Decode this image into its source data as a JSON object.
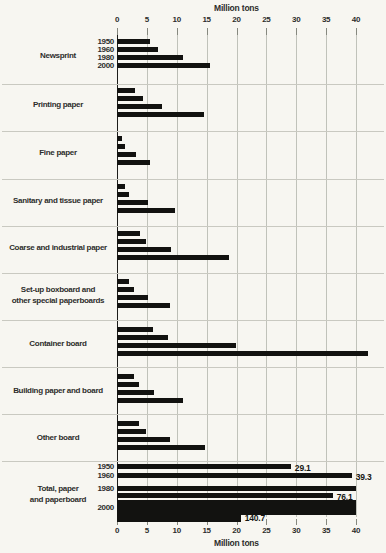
{
  "chart_data": {
    "type": "bar",
    "orientation": "horizontal",
    "unit": "Million tons",
    "top_axis_label": "Million tons",
    "bottom_axis_label": "Million tons",
    "xlim": [
      0,
      40
    ],
    "ticks": [
      0,
      5,
      10,
      15,
      20,
      25,
      30,
      35,
      40
    ],
    "grid": true,
    "series_years": [
      "1950",
      "1960",
      "1980",
      "2000"
    ],
    "groups": [
      {
        "category": "Newsprint",
        "category_lines": [
          "Newsprint"
        ],
        "values": [
          5.5,
          6.9,
          11.0,
          15.5
        ],
        "show_years": true
      },
      {
        "category": "Printing paper",
        "category_lines": [
          "Printing paper"
        ],
        "values": [
          3.0,
          4.3,
          7.5,
          14.5
        ]
      },
      {
        "category": "Fine paper",
        "category_lines": [
          "Fine paper"
        ],
        "values": [
          0.9,
          1.3,
          3.2,
          5.5
        ]
      },
      {
        "category": "Sanitary and tissue paper",
        "category_lines": [
          "Sanitary and tissue paper"
        ],
        "values": [
          1.3,
          2.0,
          5.2,
          9.7
        ]
      },
      {
        "category": "Coarse and industrial paper",
        "category_lines": [
          "Coarse and industrial paper"
        ],
        "values": [
          3.8,
          4.8,
          9.0,
          18.8
        ]
      },
      {
        "category": "Set-up boxboard and other special paperboards",
        "category_lines": [
          "Set-up boxboard and",
          "other special paperboards"
        ],
        "values": [
          2.0,
          2.9,
          5.2,
          8.9
        ]
      },
      {
        "category": "Container board",
        "category_lines": [
          "Container board"
        ],
        "values": [
          6.0,
          8.5,
          19.9,
          42.0
        ]
      },
      {
        "category": "Building paper and board",
        "category_lines": [
          "Building paper and board"
        ],
        "values": [
          2.9,
          3.7,
          6.2,
          11.0
        ]
      },
      {
        "category": "Other board",
        "category_lines": [
          "Other board"
        ],
        "values": [
          3.6,
          4.9,
          8.9,
          14.8
        ]
      },
      {
        "category": "Total, paper and paperboard",
        "category_lines": [
          "Total, paper",
          "and paperboard"
        ],
        "values": [
          29.1,
          39.3,
          76.1,
          140.7
        ],
        "value_labels": [
          "29.1",
          "39.3",
          "76.1",
          "140.7"
        ],
        "show_years": true,
        "wrapped": true
      }
    ]
  }
}
